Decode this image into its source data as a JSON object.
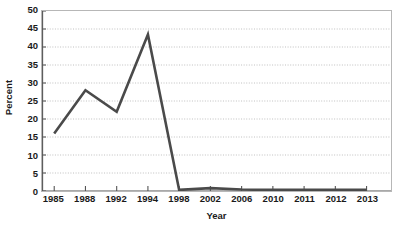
{
  "chart_data": {
    "type": "line",
    "title": "",
    "xlabel": "Year",
    "ylabel": "Percent",
    "categories": [
      "1985",
      "1988",
      "1992",
      "1994",
      "1998",
      "2002",
      "2006",
      "2010",
      "2011",
      "2012",
      "2013"
    ],
    "values": [
      16,
      28,
      22,
      43.5,
      0.3,
      0.8,
      0.4,
      0.3,
      0.3,
      0.3,
      0.3
    ],
    "series": [
      {
        "name": "Percent",
        "values": [
          16,
          28,
          22,
          43.5,
          0.3,
          0.8,
          0.4,
          0.3,
          0.3,
          0.3,
          0.3
        ],
        "color": "#4a4a4a"
      }
    ],
    "ylim": [
      0,
      50
    ],
    "ytick_step": 5,
    "yticks": [
      0,
      5,
      10,
      15,
      20,
      25,
      30,
      35,
      40,
      45,
      50
    ],
    "ytick_labels": [
      "0",
      "5",
      "10",
      "15",
      "20",
      "25",
      "30",
      "35",
      "40",
      "45",
      "50"
    ],
    "grid": true,
    "grid_axis": "y",
    "grid_style": "dotted",
    "grid_color": "#b0b0b0",
    "legend": false,
    "legend_position": "none",
    "markers": false,
    "line_width": 2.6,
    "frame": true,
    "frame_color": "#b7b7b7",
    "plot_background": "#ffffff",
    "x_right_padding_fraction": 0.07,
    "x_left_padding_fraction": 0.035
  }
}
